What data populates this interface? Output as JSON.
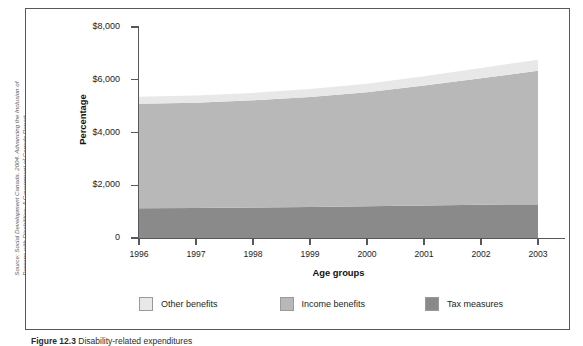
{
  "figure": {
    "source_note": "Source: Social Development Canada. 2004. Advancing the Inclusion of Persons with Disabilities: A Government of Canada Report.",
    "caption_number": "Figure 12.3",
    "caption_text": "Disability-related expenditures"
  },
  "chart_data": {
    "type": "area",
    "title": "",
    "xlabel": "Age groups",
    "ylabel": "Percentage",
    "categories": [
      "1996",
      "1997",
      "1998",
      "1999",
      "2000",
      "2001",
      "2002",
      "2003"
    ],
    "x": [
      1996,
      1997,
      1998,
      1999,
      2000,
      2001,
      2002,
      2003
    ],
    "ylim": [
      0,
      8000
    ],
    "ytick_labels": [
      "0",
      "$2,000",
      "$4,000",
      "$6,000",
      "$8,000"
    ],
    "ytick_values": [
      0,
      2000,
      4000,
      6000,
      8000
    ],
    "grid": false,
    "stacked": true,
    "legend_position": "bottom",
    "series": [
      {
        "name": "Tax measures",
        "color": "#8a8a8a",
        "values": [
          1130,
          1140,
          1160,
          1175,
          1200,
          1230,
          1260,
          1250
        ]
      },
      {
        "name": "Income benefits",
        "color": "#b8b8b8",
        "values": [
          3960,
          3990,
          4060,
          4170,
          4330,
          4550,
          4800,
          5090
        ]
      },
      {
        "name": "Other benefits",
        "color": "#e8e8e8",
        "values": [
          265,
          270,
          280,
          300,
          320,
          350,
          390,
          420
        ]
      }
    ],
    "stack_totals": [
      5355,
      5400,
      5500,
      5645,
      5850,
      6130,
      6450,
      6760
    ]
  },
  "legend": {
    "items": [
      {
        "label": "Other benefits",
        "color": "#e8e8e8"
      },
      {
        "label": "Income benefits",
        "color": "#b8b8b8"
      },
      {
        "label": "Tax measures",
        "color": "#8a8a8a"
      }
    ]
  }
}
